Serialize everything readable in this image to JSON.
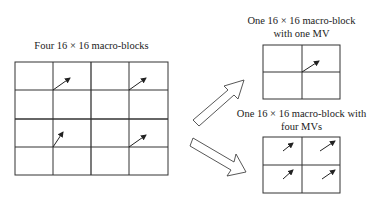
{
  "left": {
    "caption": "Four 16 × 16 macro-blocks"
  },
  "top_right": {
    "caption_line1": "One 16 × 16 macro-block",
    "caption_line2": "with one MV"
  },
  "bottom_right": {
    "caption_line1": "One 16 × 16 macro-block with",
    "caption_line2": "four MVs"
  },
  "colors": {
    "line": "#333333",
    "background": "#ffffff"
  }
}
